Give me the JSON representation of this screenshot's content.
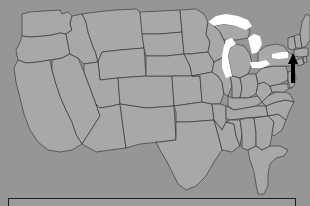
{
  "page": {
    "background_color": "#969696"
  },
  "map": {
    "name": "united-states-map",
    "land_fill": "#a8a8a8",
    "border_color": "#2a2a2a",
    "lake_fill": "#ffffff",
    "lakes_label": "Great Lakes",
    "regions": [
      "Washington",
      "Oregon",
      "California",
      "Nevada",
      "Idaho",
      "Montana",
      "Wyoming",
      "Utah",
      "Arizona",
      "Colorado",
      "New Mexico",
      "North Dakota",
      "South Dakota",
      "Nebraska",
      "Kansas",
      "Oklahoma",
      "Texas",
      "Minnesota",
      "Iowa",
      "Missouri",
      "Arkansas",
      "Louisiana",
      "Wisconsin",
      "Illinois",
      "Michigan",
      "Indiana",
      "Ohio",
      "Kentucky",
      "Tennessee",
      "Mississippi",
      "Alabama",
      "Georgia",
      "Florida",
      "South Carolina",
      "North Carolina",
      "Virginia",
      "West Virginia",
      "Maryland",
      "Delaware",
      "Pennsylvania",
      "New Jersey",
      "New York",
      "Connecticut",
      "Rhode Island",
      "Massachusetts",
      "Vermont",
      "New Hampshire",
      "Maine"
    ]
  },
  "cursor": {
    "name": "mouse-cursor-arrow",
    "color": "#000000",
    "x": 292,
    "y": 55
  },
  "bottom_panel": {
    "name": "caption-panel",
    "text": "",
    "border_color": "#1c1c1c",
    "background_color": "#9c9c9c"
  }
}
